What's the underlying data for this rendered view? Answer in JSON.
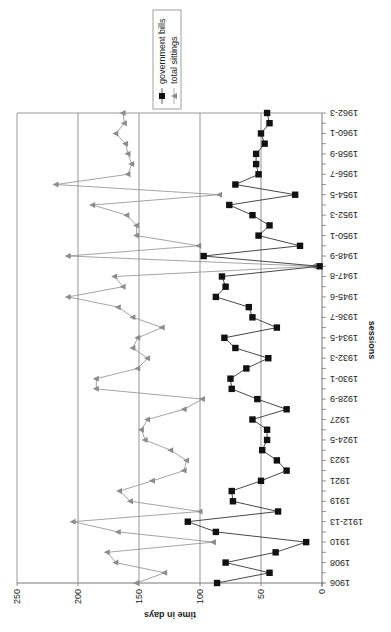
{
  "chart_data": {
    "type": "line",
    "orientation_note": "rotated: value axis horizontal (250 left to 0 right), sessions vertical (1906 bottom to 1962-3 top)",
    "title": "",
    "xlabel": "sessions",
    "ylabel": "time in days",
    "ylim": [
      0,
      250
    ],
    "yticks": [
      0,
      50,
      100,
      150,
      200,
      250
    ],
    "grid": true,
    "legend_position": "top",
    "categories": [
      "1906",
      "",
      "1908",
      "",
      "1910",
      "",
      "1912-13",
      "",
      "1919",
      "",
      "1921",
      "",
      "1923",
      "",
      "1924-5",
      "",
      "1927",
      "",
      "1928-9",
      "",
      "1930-1",
      "",
      "1932-3",
      "",
      "1934-5",
      "",
      "1936-7",
      "",
      "1945-6",
      "",
      "1947-8",
      "",
      "1948-9",
      "",
      "1950-1",
      "",
      "1952-3",
      "",
      "1954-5",
      "",
      "1956-7",
      "",
      "1958-9",
      "",
      "1960-1",
      "",
      "1962-3"
    ],
    "series": [
      {
        "name": "government bills",
        "marker": "square",
        "color": "#111111",
        "values": [
          86,
          43,
          79,
          38,
          13,
          87,
          110,
          36,
          73,
          74,
          50,
          29,
          37,
          49,
          45,
          45,
          57,
          29,
          53,
          74,
          75,
          62,
          44,
          71,
          80,
          37,
          57,
          60,
          87,
          79,
          82,
          2,
          97,
          18,
          52,
          43,
          57,
          76,
          22,
          71,
          52,
          54,
          54,
          47,
          50,
          43,
          45
        ]
      },
      {
        "name": "total sittings",
        "marker": "triangle",
        "color": "#8c8c8c",
        "values": [
          152,
          129,
          169,
          176,
          89,
          167,
          204,
          100,
          157,
          166,
          139,
          113,
          111,
          124,
          145,
          148,
          143,
          113,
          98,
          185,
          185,
          151,
          143,
          155,
          151,
          131,
          155,
          167,
          208,
          163,
          170,
          7,
          208,
          101,
          152,
          152,
          160,
          188,
          84,
          218,
          159,
          156,
          159,
          161,
          169,
          162,
          163
        ]
      }
    ]
  },
  "axis": {
    "value_ticks": [
      "250",
      "200",
      "150",
      "100",
      "50",
      "0"
    ],
    "value_title": "time in days",
    "category_title": "sessions",
    "category_labels": [
      "1906",
      "1908",
      "1910",
      "1912-13",
      "1919",
      "1921",
      "1923",
      "1924-5",
      "1927",
      "1928-9",
      "1930-1",
      "1932-3",
      "1934-5",
      "1936-7",
      "1945-6",
      "1947-8",
      "1948-9",
      "1950-1",
      "1952-3",
      "1954-5",
      "1956-7",
      "1958-9",
      "1960-1",
      "1962-3"
    ]
  },
  "legend": {
    "items": [
      {
        "label": "government bills",
        "marker": "square"
      },
      {
        "label": "total sittings",
        "marker": "triangle"
      }
    ]
  },
  "colors": {
    "gridline": "#7a7a7a",
    "bills_line": "#333333",
    "bills_marker": "#111111",
    "sittings_line": "#9a9a9a",
    "sittings_marker": "#8c8c8c"
  }
}
